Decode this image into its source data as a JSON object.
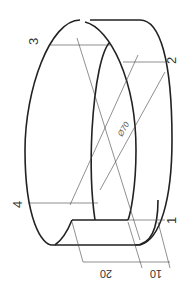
{
  "drawing": {
    "type": "isometric ring with notch",
    "labels": {
      "p1": "1",
      "p2": "2",
      "p3": "3",
      "p4": "4"
    },
    "dimensions": {
      "diameter": "Ø70",
      "width_a": "20",
      "width_b": "10"
    },
    "colors": {
      "line": "#222222",
      "background": "#ffffff"
    }
  }
}
